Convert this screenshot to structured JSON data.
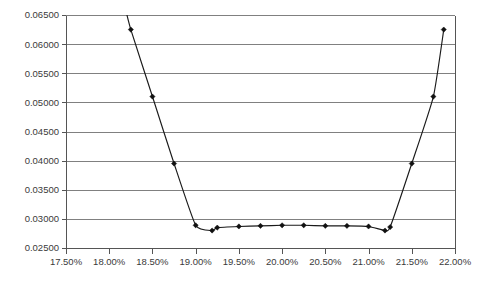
{
  "chart_data": {
    "type": "line",
    "title": "",
    "subtitle": "",
    "xlabel": "",
    "ylabel": "",
    "xlim": [
      17.5,
      22.0
    ],
    "ylim": [
      0.025,
      0.065
    ],
    "grid": true,
    "legend": false,
    "legend_position": "none",
    "marker": "diamond",
    "line_color": "#1a1a1a",
    "grid_color": "#808080",
    "axis_color": "#555555",
    "x_tick_labels": [
      "17.50%",
      "18.00%",
      "18.50%",
      "19.00%",
      "19.50%",
      "20.00%",
      "20.50%",
      "21.00%",
      "21.50%",
      "22.00%"
    ],
    "x_tick_values": [
      17.5,
      18.0,
      18.5,
      19.0,
      19.5,
      20.0,
      20.5,
      21.0,
      21.5,
      22.0
    ],
    "y_tick_labels": [
      "0.02500",
      "0.03000",
      "0.03500",
      "0.04000",
      "0.04500",
      "0.05000",
      "0.05500",
      "0.06000",
      "0.06500"
    ],
    "y_tick_values": [
      0.025,
      0.03,
      0.035,
      0.04,
      0.045,
      0.05,
      0.055,
      0.06,
      0.065
    ],
    "series": [
      {
        "name": "series-1",
        "x": [
          18.18,
          18.25,
          18.5,
          18.75,
          19.0,
          19.19,
          19.25,
          19.5,
          19.75,
          20.0,
          20.25,
          20.5,
          20.75,
          21.0,
          21.19,
          21.25,
          21.5,
          21.75,
          21.87
        ],
        "y": [
          0.0665,
          0.0625,
          0.051,
          0.0395,
          0.0289,
          0.028,
          0.0285,
          0.0287,
          0.0288,
          0.0289,
          0.0289,
          0.0288,
          0.0288,
          0.0287,
          0.028,
          0.0286,
          0.0395,
          0.051,
          0.0625
        ]
      }
    ]
  },
  "axes": {
    "y_axis_name": "value-axis",
    "x_axis_name": "percent-axis"
  }
}
